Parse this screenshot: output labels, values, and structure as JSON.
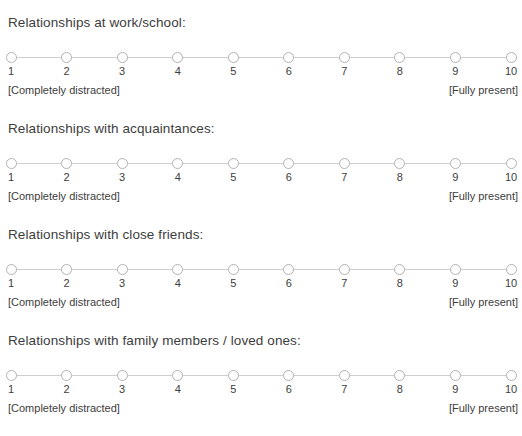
{
  "survey": {
    "scale": {
      "min": 1,
      "max": 10,
      "tick_labels": [
        "1",
        "2",
        "3",
        "4",
        "5",
        "6",
        "7",
        "8",
        "9",
        "10"
      ],
      "anchor_low": "[Completely distracted]",
      "anchor_high": "[Fully present]",
      "point_color": "#b2b2b2",
      "track_color": "#cfcfcf",
      "text_color": "#3d3d3d"
    },
    "questions": [
      {
        "title": "Relationships at work/school:",
        "selected": null
      },
      {
        "title": "Relationships with acquaintances:",
        "selected": null
      },
      {
        "title": "Relationships with close friends:",
        "selected": null
      },
      {
        "title": "Relationships with family members / loved ones:",
        "selected": null
      }
    ]
  }
}
